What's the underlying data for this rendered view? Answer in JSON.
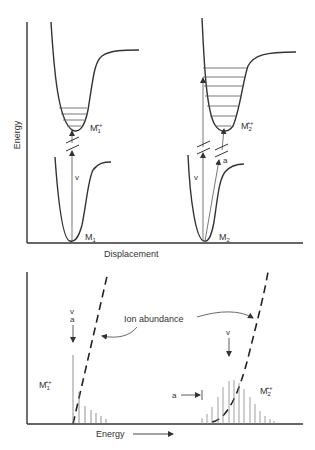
{
  "top_panel": {
    "y_axis_label": "Energy",
    "x_axis_label": "Displacement",
    "left_molecule": {
      "neutral_label": "M",
      "neutral_sub": "1",
      "ion_label": "M",
      "ion_sub": "1",
      "ion_sup": "•+",
      "transition_label": "v"
    },
    "right_molecule": {
      "neutral_label": "M",
      "neutral_sub": "2",
      "ion_label": "M",
      "ion_sub": "2",
      "ion_sup": "•+",
      "vertical_label": "v",
      "adiabatic_label": "a"
    }
  },
  "bottom_panel": {
    "x_axis_label": "Energy",
    "curve_label": "Ion abundance",
    "left_spectrum": {
      "ion_label": "M",
      "ion_sub": "1",
      "ion_sup": "•+",
      "marker_v": "v",
      "marker_a": "a"
    },
    "right_spectrum": {
      "ion_label": "M",
      "ion_sub": "2",
      "ion_sup": "•+",
      "marker_v": "v",
      "marker_a": "a"
    }
  },
  "colors": {
    "line": "#333333",
    "thin_line": "#666666",
    "background": "#ffffff"
  }
}
